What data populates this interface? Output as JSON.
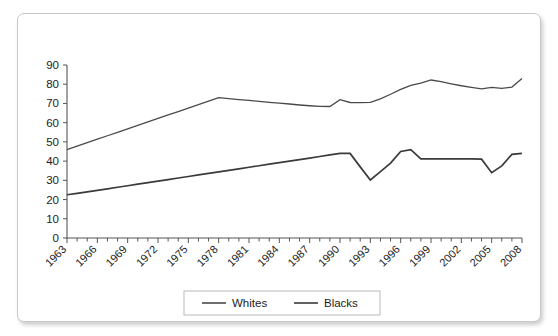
{
  "chart_data": {
    "type": "line",
    "title": "",
    "subtitle": "",
    "xlabel": "",
    "ylabel": "",
    "xlim": [
      1963,
      2008
    ],
    "ylim": [
      0,
      90
    ],
    "ytick_step": 10,
    "grid": false,
    "legend_position": "bottom",
    "yticks": [
      0,
      10,
      20,
      30,
      40,
      50,
      60,
      70,
      80,
      90
    ],
    "ytick_labels": [
      "0",
      "10",
      "20",
      "30",
      "40",
      "50",
      "60",
      "70",
      "80",
      "90"
    ],
    "xtick_labels": [
      "1963",
      "1966",
      "1969",
      "1972",
      "1975",
      "1978",
      "1981",
      "1984",
      "1987",
      "1990",
      "1993",
      "1996",
      "1999",
      "2002",
      "2005",
      "2008"
    ],
    "x": [
      1963,
      1964,
      1965,
      1966,
      1967,
      1968,
      1969,
      1970,
      1971,
      1972,
      1973,
      1974,
      1975,
      1976,
      1977,
      1978,
      1979,
      1980,
      1981,
      1982,
      1983,
      1984,
      1985,
      1986,
      1987,
      1988,
      1989,
      1990,
      1991,
      1992,
      1993,
      1994,
      1995,
      1996,
      1997,
      1998,
      1999,
      2000,
      2001,
      2002,
      2003,
      2004,
      2005,
      2006,
      2007,
      2008
    ],
    "series": [
      {
        "name": "Whites",
        "color": "#4a4a4a",
        "width": 1.3,
        "values": [
          46.0,
          47.8,
          49.6,
          51.4,
          53.2,
          55.0,
          56.8,
          58.6,
          60.4,
          62.2,
          64.0,
          65.8,
          67.6,
          69.4,
          71.2,
          73.0,
          72.5,
          72.0,
          71.6,
          71.1,
          70.6,
          70.2,
          69.7,
          69.2,
          68.8,
          68.5,
          68.4,
          72.0,
          70.5,
          70.4,
          70.6,
          72.4,
          74.8,
          77.3,
          79.4,
          80.6,
          82.2,
          81.3,
          80.2,
          79.2,
          78.4,
          77.6,
          78.4,
          77.8,
          78.5,
          83.0
        ]
      },
      {
        "name": "Blacks",
        "color": "#3a3a3a",
        "width": 1.7,
        "values": [
          22.5,
          23.2,
          24.0,
          24.8,
          25.6,
          26.4,
          27.2,
          28.0,
          28.8,
          29.6,
          30.4,
          31.2,
          32.0,
          32.8,
          33.6,
          34.4,
          35.2,
          36.0,
          36.8,
          37.6,
          38.4,
          39.2,
          40.0,
          40.8,
          41.6,
          42.4,
          43.2,
          44.0,
          44.0,
          37.0,
          30.2,
          34.5,
          39.0,
          45.0,
          46.0,
          41.2,
          41.2,
          41.2,
          41.2,
          41.2,
          41.2,
          41.0,
          34.0,
          37.5,
          43.5,
          44.0
        ]
      }
    ],
    "legend": [
      {
        "label": "Whites",
        "color": "#4a4a4a"
      },
      {
        "label": "Blacks",
        "color": "#3a3a3a"
      }
    ]
  },
  "figure": {
    "background": "#ffffff",
    "frame_border_color": "#c9c9c9",
    "axis_color": "#555555",
    "text_color": "#1c1c1c"
  }
}
